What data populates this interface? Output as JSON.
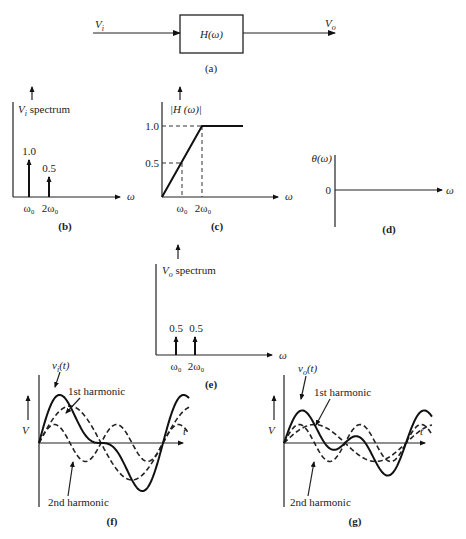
{
  "panel_a": {
    "caption": "(a)",
    "input_label": "V",
    "input_sub": "i",
    "output_label": "V",
    "output_sub": "o",
    "block_label": "H(ω)"
  },
  "panel_b": {
    "caption": "(b)",
    "title": "V",
    "title_sub": "i",
    "title_rest": " spectrum",
    "x_axis_label": "ω",
    "ticks": [
      "ω₀",
      "2ω₀"
    ],
    "impulses": [
      {
        "label": "1.0",
        "value": 1.0
      },
      {
        "label": "0.5",
        "value": 0.5
      }
    ]
  },
  "panel_c": {
    "caption": "(c)",
    "title": "|H (ω)|",
    "x_axis_label": "ω",
    "y_ticks": [
      "1.0",
      "0.5"
    ],
    "x_ticks": [
      "ω₀",
      "2ω₀"
    ]
  },
  "panel_d": {
    "caption": "(d)",
    "title": "θ(ω)",
    "zero_label": "0",
    "x_axis_label": "ω"
  },
  "panel_e": {
    "caption": "(e)",
    "title": "V",
    "title_sub": "o",
    "title_rest": " spectrum",
    "x_axis_label": "ω",
    "ticks": [
      "ω₀",
      "2ω₀"
    ],
    "impulses": [
      {
        "label": "0.5",
        "value": 0.5
      },
      {
        "label": "0.5",
        "value": 0.5
      }
    ]
  },
  "panel_f": {
    "caption": "(f)",
    "signal_label": "v",
    "signal_sub": "i",
    "signal_rest": "(t)",
    "first_harmonic_label": "1st harmonic",
    "second_harmonic_label": "2nd harmonic",
    "y_axis_label": "V",
    "x_axis_label": "t"
  },
  "panel_g": {
    "caption": "(g)",
    "signal_label": "v",
    "signal_sub": "o",
    "signal_rest": "(t)",
    "first_harmonic_label": "1st harmonic",
    "second_harmonic_label": "2nd harmonic",
    "y_axis_label": "V",
    "x_axis_label": "t"
  },
  "chart_data": [
    {
      "type": "bar",
      "title": "Vi spectrum",
      "categories": [
        "ω₀",
        "2ω₀"
      ],
      "values": [
        1.0,
        0.5
      ],
      "xlabel": "ω",
      "ylabel": "Vi spectrum"
    },
    {
      "type": "line",
      "title": "|H(ω)|",
      "x": [
        0,
        1,
        2,
        3
      ],
      "values": [
        0,
        0.5,
        1.0,
        1.0
      ],
      "xlabel": "ω (units of ω₀)",
      "ylabel": "|H(ω)|",
      "ylim": [
        0,
        1.0
      ]
    },
    {
      "type": "line",
      "title": "θ(ω)",
      "x": [
        0,
        3
      ],
      "values": [
        0,
        0
      ],
      "xlabel": "ω",
      "ylabel": "θ(ω)"
    },
    {
      "type": "bar",
      "title": "Vo spectrum",
      "categories": [
        "ω₀",
        "2ω₀"
      ],
      "values": [
        0.5,
        0.5
      ],
      "xlabel": "ω",
      "ylabel": "Vo spectrum"
    },
    {
      "type": "line",
      "title": "vi(t)",
      "series": [
        {
          "name": "1st harmonic",
          "amplitude": 1.0
        },
        {
          "name": "2nd harmonic",
          "amplitude": 0.5
        },
        {
          "name": "vi(t)",
          "amplitude": "sum"
        }
      ],
      "xlabel": "t",
      "ylabel": "V"
    },
    {
      "type": "line",
      "title": "vo(t)",
      "series": [
        {
          "name": "1st harmonic",
          "amplitude": 0.5
        },
        {
          "name": "2nd harmonic",
          "amplitude": 0.5
        },
        {
          "name": "vo(t)",
          "amplitude": "sum"
        }
      ],
      "xlabel": "t",
      "ylabel": "V"
    }
  ]
}
